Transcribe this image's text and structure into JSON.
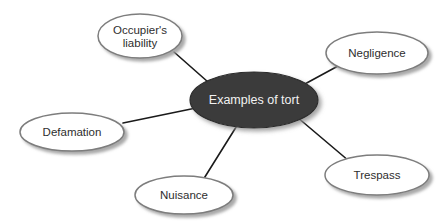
{
  "diagram": {
    "type": "radial-mind-map",
    "title": "Examples of tort",
    "background_color": "#ffffff",
    "center_node": {
      "id": "center",
      "label": "Examples of tort",
      "fill_color": "#3a3a3a",
      "text_color": "#f2f2f2",
      "border_color": "#2b2b2b",
      "cx": 254,
      "cy": 100,
      "rx": 64,
      "ry": 28
    },
    "satellite_style": {
      "fill_color": "#ffffff",
      "text_color": "#2e2e2e",
      "border_color": "#7d7d7d",
      "shadow_color": "#9a9a9a"
    },
    "connector_color": "#1a1a1a",
    "satellites": [
      {
        "id": "occupiers-liability",
        "label": "Occupier's liability",
        "lines": [
          "Occupier's",
          "liability"
        ],
        "cx": 140,
        "cy": 36,
        "rx": 42,
        "ry": 22,
        "edge": {
          "x1": 208,
          "y1": 82,
          "x2": 174,
          "y2": 52
        }
      },
      {
        "id": "negligence",
        "label": "Negligence",
        "lines": [
          "Negligence"
        ],
        "cx": 377,
        "cy": 53,
        "rx": 51,
        "ry": 21,
        "edge": {
          "x1": 303,
          "y1": 85,
          "x2": 338,
          "y2": 66
        }
      },
      {
        "id": "trespass",
        "label": "Trespass",
        "lines": [
          "Trespass"
        ],
        "cx": 377,
        "cy": 175,
        "rx": 52,
        "ry": 20,
        "edge": {
          "x1": 297,
          "y1": 117,
          "x2": 349,
          "y2": 161
        }
      },
      {
        "id": "defamation",
        "label": "Defamation",
        "lines": [
          "Defamation"
        ],
        "cx": 72,
        "cy": 132,
        "rx": 52,
        "ry": 19,
        "edge": {
          "x1": 196,
          "y1": 108,
          "x2": 123,
          "y2": 123
        }
      },
      {
        "id": "nuisance",
        "label": "Nuisance",
        "lines": [
          "Nuisance"
        ],
        "cx": 184,
        "cy": 195,
        "rx": 49,
        "ry": 19,
        "edge": {
          "x1": 238,
          "y1": 124,
          "x2": 203,
          "y2": 180
        }
      }
    ]
  }
}
